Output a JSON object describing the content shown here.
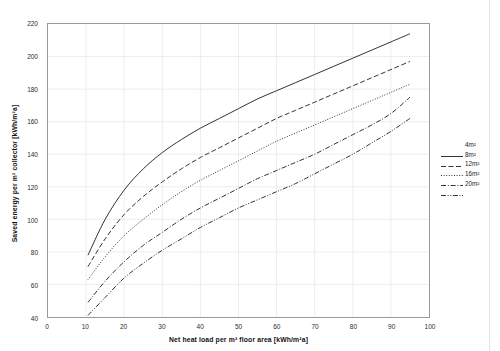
{
  "chart_data": {
    "type": "line",
    "title": "",
    "xlabel": "Net heat load per m² floor area [kWh/m²a]",
    "ylabel": "Saved energy per m² collector [kWh/m²a]",
    "xlim": [
      0,
      100
    ],
    "ylim": [
      40,
      220
    ],
    "xticks": [
      0,
      10,
      20,
      30,
      40,
      50,
      60,
      70,
      80,
      90,
      100
    ],
    "yticks": [
      40,
      60,
      80,
      100,
      120,
      140,
      160,
      180,
      200,
      220
    ],
    "grid": true,
    "legend_position": "right",
    "series": [
      {
        "name": "4m²",
        "dash": "solid",
        "color": "#1c1c1c",
        "x": [
          10.5,
          15,
          20,
          25,
          30,
          35,
          40,
          45,
          50,
          55,
          60,
          65,
          70,
          75,
          80,
          85,
          90,
          95
        ],
        "y": [
          78,
          100,
          118,
          131,
          141,
          149,
          156,
          162,
          168,
          174,
          179,
          184,
          189,
          194,
          199,
          204,
          209,
          214
        ]
      },
      {
        "name": "8m²",
        "dash": "dashed",
        "color": "#1c1c1c",
        "x": [
          10.5,
          15,
          20,
          25,
          30,
          35,
          40,
          45,
          50,
          55,
          60,
          65,
          70,
          75,
          80,
          85,
          90,
          95
        ],
        "y": [
          71,
          88,
          103,
          114,
          123,
          131,
          138,
          144,
          150,
          156,
          162,
          167,
          172,
          177,
          182,
          187,
          192,
          197
        ]
      },
      {
        "name": "12m²",
        "dash": "dotted",
        "color": "#1c1c1c",
        "x": [
          10.5,
          15,
          20,
          25,
          30,
          35,
          40,
          45,
          50,
          55,
          60,
          65,
          70,
          75,
          80,
          85,
          90,
          95
        ],
        "y": [
          63,
          77,
          90,
          100,
          109,
          117,
          124,
          130,
          136,
          142,
          148,
          153,
          158,
          163,
          168,
          173,
          178,
          183
        ]
      },
      {
        "name": "16m²",
        "dash": "dashdot",
        "color": "#1c1c1c",
        "x": [
          10.5,
          15,
          20,
          25,
          30,
          35,
          40,
          45,
          50,
          55,
          60,
          65,
          70,
          75,
          80,
          85,
          90,
          95
        ],
        "y": [
          49,
          62,
          74,
          84,
          92,
          100,
          107,
          113,
          119,
          125,
          130,
          135,
          140,
          146,
          152,
          158,
          165,
          175
        ]
      },
      {
        "name": "20m²",
        "dash": "dashdotdot",
        "color": "#1c1c1c",
        "x": [
          10.5,
          15,
          20,
          25,
          30,
          35,
          40,
          45,
          50,
          55,
          60,
          65,
          70,
          75,
          80,
          85,
          90,
          95
        ],
        "y": [
          41,
          52,
          64,
          73,
          81,
          88,
          95,
          101,
          107,
          112,
          117,
          122,
          128,
          134,
          140,
          147,
          154,
          162
        ]
      }
    ]
  },
  "legend": {
    "items": [
      {
        "label": "4m²",
        "dash": "solid"
      },
      {
        "label": "8m²",
        "dash": "dashed"
      },
      {
        "label": "12m²",
        "dash": "dotted"
      },
      {
        "label": "16m²",
        "dash": "dashdot"
      },
      {
        "label": "20m²",
        "dash": "dashdotdot"
      }
    ]
  },
  "colors": {
    "line": "#1c1c1c",
    "grid": "#ededed",
    "frame": "#9a9a9a",
    "text": "#1a1a1a",
    "background": "#ffffff"
  }
}
